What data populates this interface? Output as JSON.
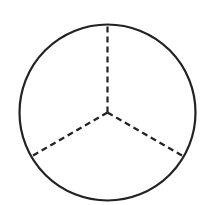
{
  "diagram": {
    "type": "circle-divided-into-thirds",
    "background": "#ffffff",
    "stroke_color": "#222222",
    "circle": {
      "cx": 107.5,
      "cy": 112.5,
      "r": 88,
      "stroke_width": 2.2
    },
    "divider_style": "dashed",
    "divider_count": 3,
    "divider_angles_deg": [
      90,
      210,
      330
    ],
    "dash_pattern": "6 4",
    "divider_stroke_width": 2.2
  }
}
